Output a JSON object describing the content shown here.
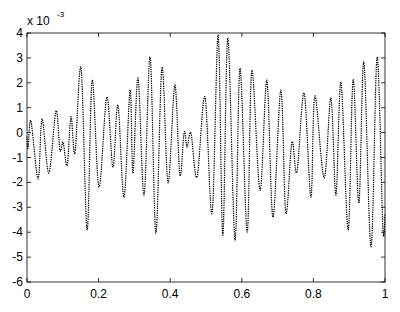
{
  "chart_data": {
    "type": "line",
    "title": "",
    "xlabel": "",
    "ylabel": "",
    "y_scale_label": "x 10",
    "y_scale_exponent": "-3",
    "xlim": [
      0,
      1
    ],
    "ylim": [
      -6,
      4
    ],
    "grid": false,
    "legend": null,
    "line_style": "dotted",
    "line_color": "#000000",
    "x_ticks": [
      0,
      0.2,
      0.4,
      0.6,
      0.8,
      1
    ],
    "x_tick_labels": [
      "0",
      "0.2",
      "0.4",
      "0.6",
      "0.8",
      "1"
    ],
    "y_ticks": [
      -6,
      -5,
      -4,
      -3,
      -2,
      -1,
      0,
      1,
      2,
      3,
      4
    ],
    "y_tick_labels": [
      "-6",
      "-5",
      "-4",
      "-3",
      "-2",
      "-1",
      "0",
      "1",
      "2",
      "3",
      "4"
    ],
    "series": [
      {
        "name": "signal",
        "units": "x 1e-3",
        "x": [
          0.0,
          0.003,
          0.011,
          0.031,
          0.042,
          0.061,
          0.081,
          0.092,
          0.101,
          0.112,
          0.123,
          0.134,
          0.151,
          0.168,
          0.182,
          0.201,
          0.223,
          0.24,
          0.254,
          0.271,
          0.288,
          0.296,
          0.31,
          0.327,
          0.344,
          0.36,
          0.377,
          0.394,
          0.413,
          0.427,
          0.439,
          0.447,
          0.458,
          0.475,
          0.497,
          0.517,
          0.534,
          0.547,
          0.561,
          0.581,
          0.595,
          0.615,
          0.628,
          0.651,
          0.67,
          0.687,
          0.709,
          0.723,
          0.74,
          0.754,
          0.774,
          0.793,
          0.804,
          0.83,
          0.849,
          0.863,
          0.877,
          0.897,
          0.911,
          0.927,
          0.941,
          0.961,
          0.978,
          0.994,
          1.0
        ],
        "values": [
          -0.18,
          -0.62,
          0.47,
          -1.86,
          0.55,
          -1.62,
          0.87,
          -0.7,
          -0.39,
          -1.31,
          0.63,
          -0.82,
          2.59,
          -3.91,
          2.11,
          -2.18,
          1.43,
          -1.38,
          1.11,
          -2.59,
          1.71,
          -1.63,
          2.19,
          -2.51,
          3.04,
          -4.04,
          2.63,
          -2.02,
          1.91,
          -1.71,
          0.02,
          -0.58,
          -0.02,
          -1.78,
          1.43,
          -3.24,
          3.92,
          -4.12,
          3.8,
          -4.32,
          2.59,
          -3.99,
          2.51,
          -2.31,
          2.11,
          -3.39,
          1.71,
          -3.23,
          -0.38,
          -1.58,
          1.59,
          -2.59,
          1.47,
          -1.82,
          1.39,
          -2.51,
          2.03,
          -3.91,
          2.15,
          -2.83,
          2.84,
          -4.59,
          3.04,
          -3.79,
          -3.31
        ]
      }
    ]
  }
}
